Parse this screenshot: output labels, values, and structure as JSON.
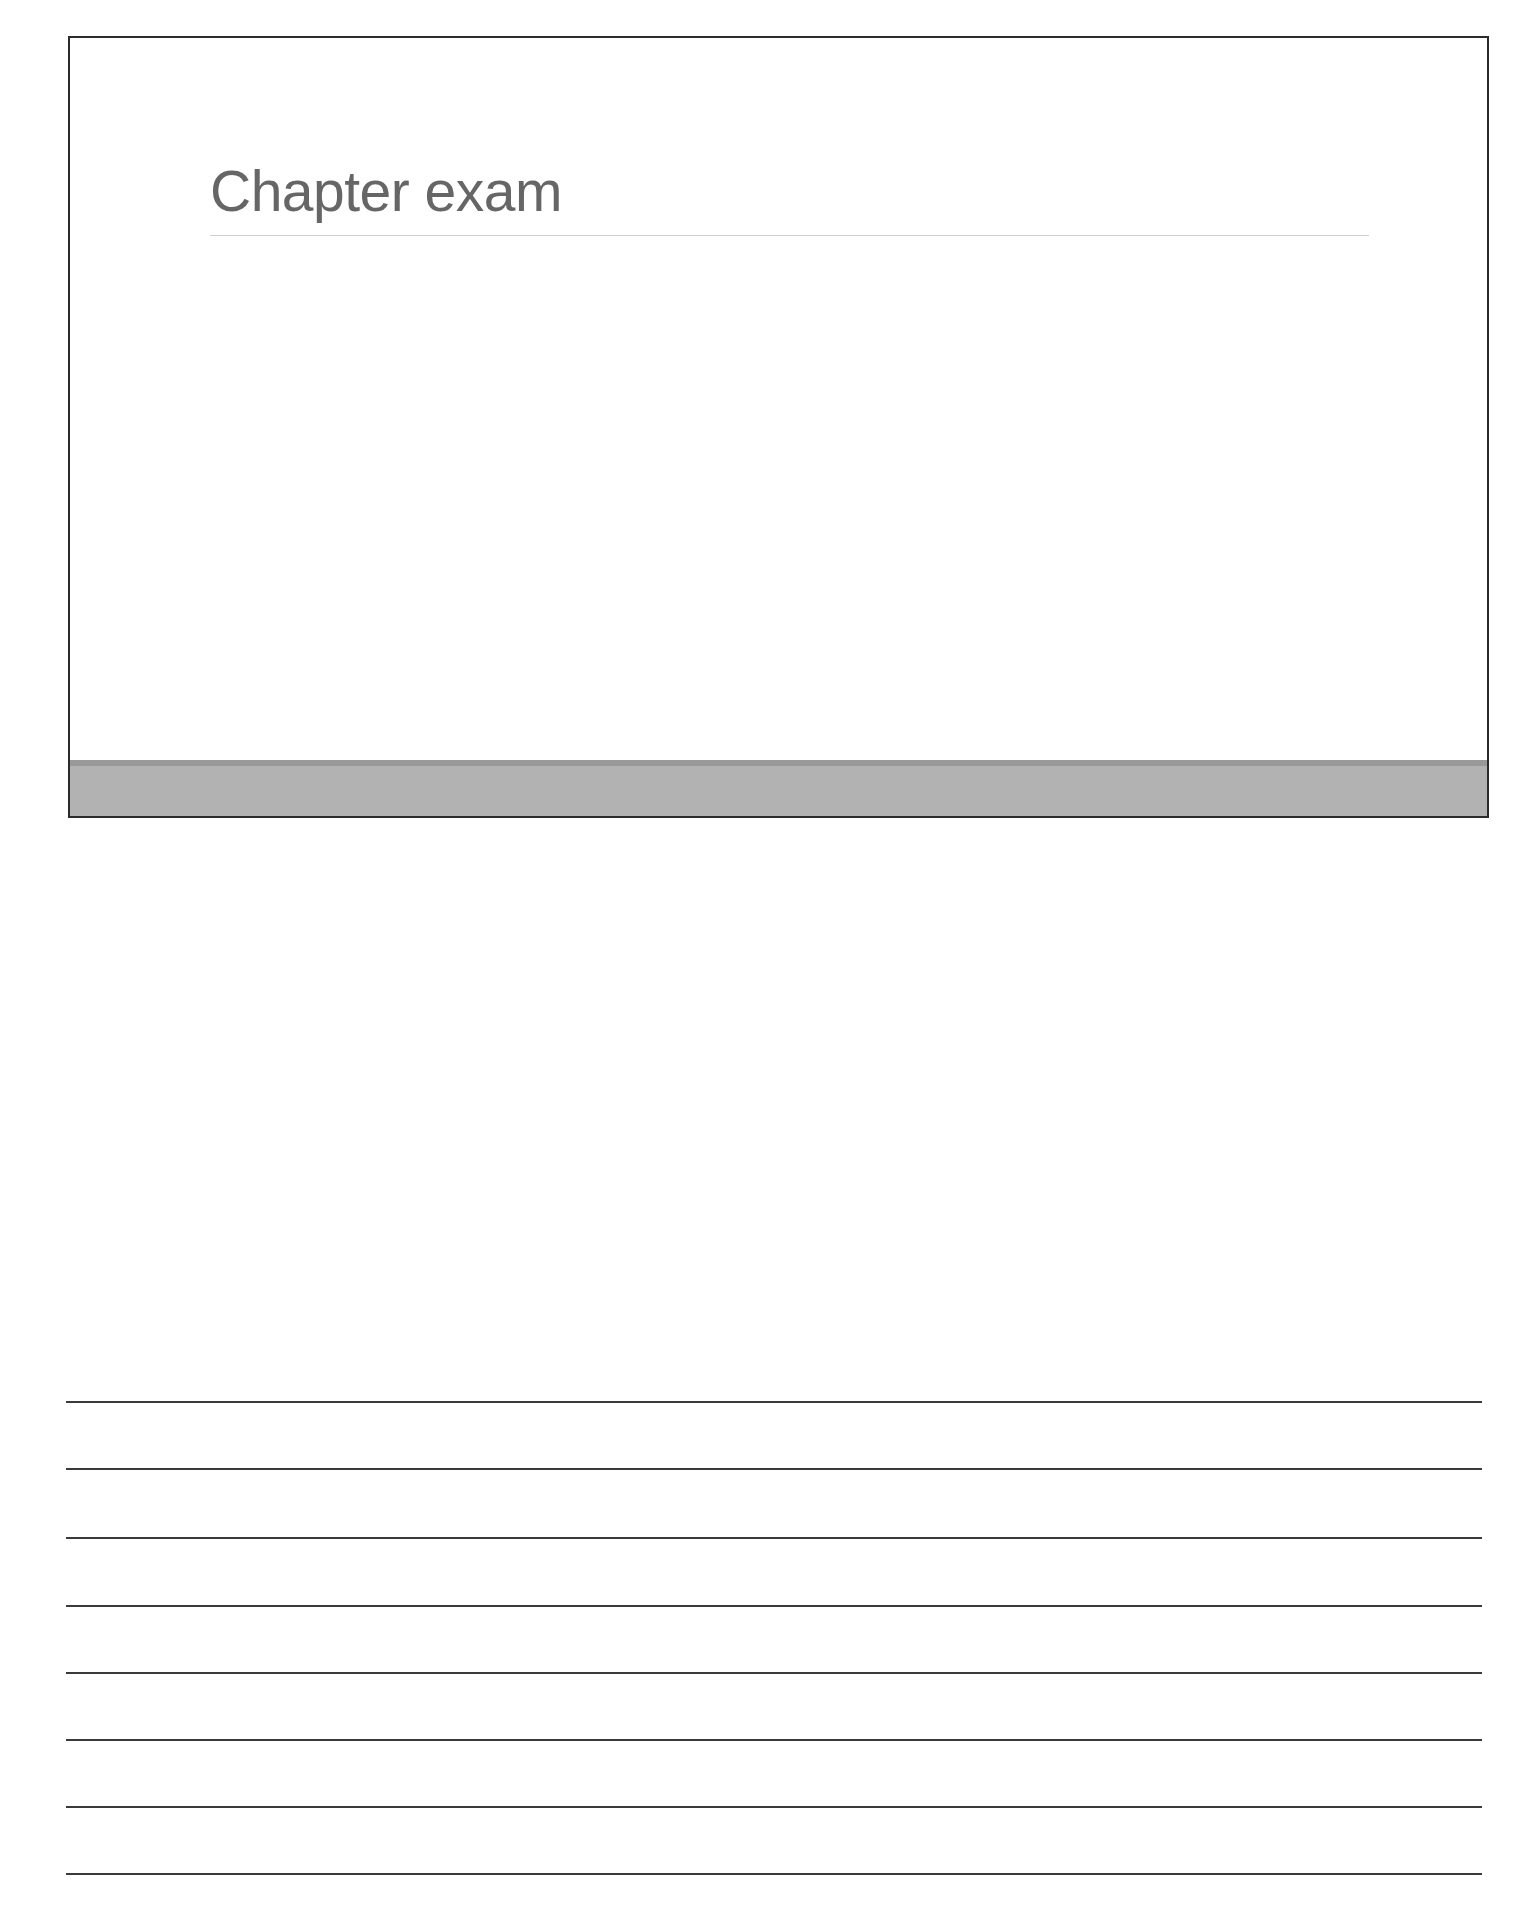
{
  "slide": {
    "title": "Chapter exam",
    "colors": {
      "title_text": "#666666",
      "title_rule": "#cfcfcf",
      "border": "#2b2b2b",
      "footer_bar": "#b2b2b2",
      "footer_bar_strip": "#999999"
    }
  },
  "notes": {
    "line_count": 8,
    "line_color": "#3a3a3a"
  }
}
